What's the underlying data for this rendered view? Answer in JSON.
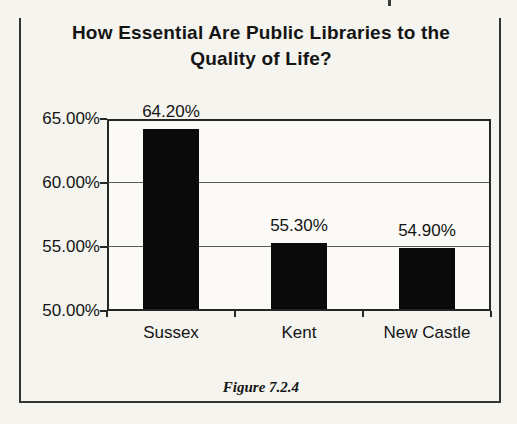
{
  "figure": {
    "caption": "Figure 7.2.4"
  },
  "chart_data": {
    "type": "bar",
    "title": "How Essential Are Public Libraries to the Quality of Life?",
    "title_lines": [
      "How Essential Are Public Libraries to the",
      "Quality of Life?"
    ],
    "categories": [
      "Sussex",
      "Kent",
      "New Castle"
    ],
    "values": [
      64.2,
      55.3,
      54.9
    ],
    "value_labels": [
      "64.20%",
      "55.30%",
      "54.90%"
    ],
    "y_ticks": [
      {
        "value": 65,
        "label": "65.00%"
      },
      {
        "value": 60,
        "label": "60.00%"
      },
      {
        "value": 55,
        "label": "55.00%"
      },
      {
        "value": 50,
        "label": "50.00%"
      }
    ],
    "ylim": [
      50,
      65
    ],
    "xlabel": "",
    "ylabel": "",
    "grid": true,
    "legend": false,
    "bar_color": "#0a0a0a",
    "background_color": "#f5f4ef"
  }
}
